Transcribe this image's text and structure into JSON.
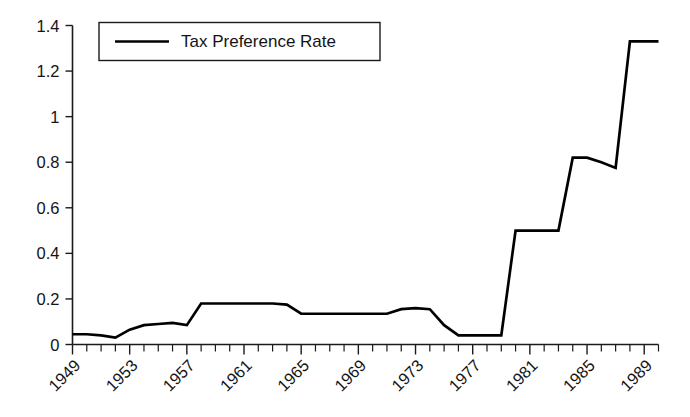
{
  "chart_data": {
    "type": "line",
    "title": "",
    "subtitle": "",
    "xlabel": "",
    "ylabel": "",
    "grid": false,
    "legend_position": "top-left",
    "xlim": [
      1949,
      1990
    ],
    "ylim": [
      0,
      1.4
    ],
    "y_ticks": [
      0,
      0.2,
      0.4,
      0.6,
      0.8,
      1,
      1.2,
      1.4
    ],
    "y_tick_labels": [
      "0",
      "0.2",
      "0.4",
      "0.6",
      "0.8",
      "1",
      "1.2",
      "1.4"
    ],
    "x_tick_labels": [
      "1949",
      "1953",
      "1957",
      "1961",
      "1965",
      "1969",
      "1973",
      "1977",
      "1981",
      "1985",
      "1989"
    ],
    "x_tick_values": [
      1949,
      1953,
      1957,
      1961,
      1965,
      1969,
      1973,
      1977,
      1981,
      1985,
      1989
    ],
    "x_minor_step": 1,
    "series": [
      {
        "name": "Tax Preference Rate",
        "color": "#000000",
        "x": [
          1949,
          1950,
          1951,
          1952,
          1953,
          1954,
          1955,
          1956,
          1957,
          1958,
          1959,
          1960,
          1961,
          1962,
          1963,
          1964,
          1965,
          1966,
          1967,
          1968,
          1969,
          1970,
          1971,
          1972,
          1973,
          1974,
          1975,
          1976,
          1977,
          1978,
          1979,
          1980,
          1981,
          1982,
          1983,
          1984,
          1985,
          1986,
          1987,
          1988,
          1989,
          1990
        ],
        "values": [
          0.045,
          0.045,
          0.04,
          0.03,
          0.065,
          0.085,
          0.09,
          0.095,
          0.085,
          0.18,
          0.18,
          0.18,
          0.18,
          0.18,
          0.18,
          0.175,
          0.135,
          0.135,
          0.135,
          0.135,
          0.135,
          0.135,
          0.135,
          0.155,
          0.16,
          0.155,
          0.085,
          0.04,
          0.04,
          0.04,
          0.04,
          0.5,
          0.5,
          0.5,
          0.5,
          0.82,
          0.82,
          0.8,
          0.775,
          1.33,
          1.33,
          1.33
        ]
      }
    ],
    "legend": {
      "entries": [
        {
          "label": "Tax Preference Rate",
          "color": "#000000",
          "marker": "line"
        }
      ]
    }
  },
  "legend_text": "Tax Preference Rate"
}
